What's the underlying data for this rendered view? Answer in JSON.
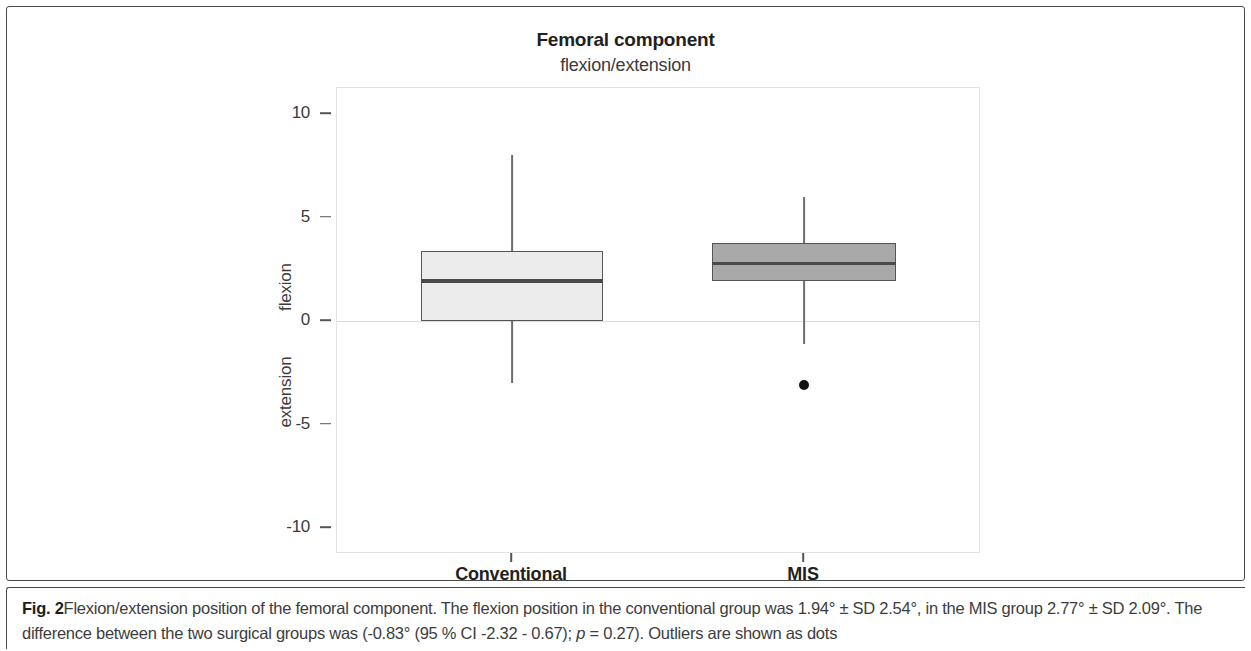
{
  "figure": {
    "label": "Fig. 2",
    "caption_text": "Flexion/extension position of the femoral component. The flexion position in the conventional group was 1.94° ± SD 2.54°, in the MIS group 2.77° ± SD 2.09°. The difference between the two surgical groups was (-0.83° (95 % CI -2.32 - 0.67); ",
    "caption_p_italic": "p",
    "caption_tail": " = 0.27). Outliers are shown as dots"
  },
  "chart_data": {
    "type": "box",
    "title": "Femoral component",
    "subtitle": "flexion/extension",
    "xlabel": "",
    "ylabel": "Angle (degrees)",
    "ylabel_upper": "flexion",
    "ylabel_lower": "extension",
    "ylim": [
      -11.5,
      11.0
    ],
    "yticks": [
      10,
      5,
      0,
      -5,
      -10
    ],
    "ytick_labels": [
      "10",
      "5",
      "0",
      "-5",
      "-10"
    ],
    "categories": [
      "Conventional",
      "MIS"
    ],
    "grid": false,
    "zero_reference_line": 0,
    "legend": null,
    "colors": {
      "conventional_fill": "#ececec",
      "mis_fill": "#a8a8a8",
      "box_border": "#555555",
      "median": "#4a4a4a",
      "whisker": "#6d6d6d",
      "outlier": "#141414",
      "plot_border": "#e3e3e3",
      "zero_line": "#dcdcdc"
    },
    "boxes": [
      {
        "name": "Conventional",
        "whisker_low": -3.0,
        "q1": 0.0,
        "median": 1.94,
        "q3": 3.4,
        "whisker_high": 8.0,
        "outliers": [],
        "fill": "#ececec"
      },
      {
        "name": "MIS",
        "whisker_low": -1.1,
        "q1": 1.95,
        "median": 2.77,
        "q3": 3.75,
        "whisker_high": 6.0,
        "outliers": [
          -3.1
        ],
        "fill": "#a8a8a8"
      }
    ],
    "annotations": {
      "conventional_mean": "1.94° ± SD 2.54°",
      "mis_mean": "2.77° ± SD 2.09°",
      "difference": "-0.83°",
      "ci_95": "-2.32 - 0.67",
      "p_value": "0.27"
    }
  }
}
